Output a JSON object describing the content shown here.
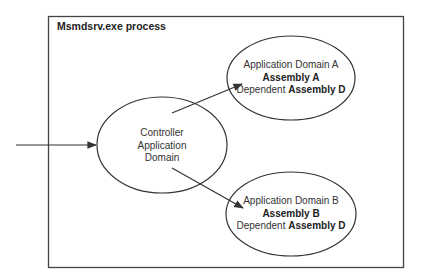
{
  "process_box": {
    "title": "Msmdsrv.exe process"
  },
  "nodes": {
    "controller": {
      "line1": "Controller",
      "line2": "Application",
      "line3": "Domain"
    },
    "domain_a": {
      "name": "Application Domain A",
      "assembly": "Assembly A",
      "dependent_prefix": "Dependent",
      "dependent_assembly": "Assembly D"
    },
    "domain_b": {
      "name": "Application Domain B",
      "assembly": "Assembly B",
      "dependent_prefix": "Dependent",
      "dependent_assembly": "Assembly D"
    }
  },
  "edges": [
    {
      "from": "external",
      "to": "controller"
    },
    {
      "from": "controller",
      "to": "domain_a"
    },
    {
      "from": "controller",
      "to": "domain_b"
    }
  ]
}
